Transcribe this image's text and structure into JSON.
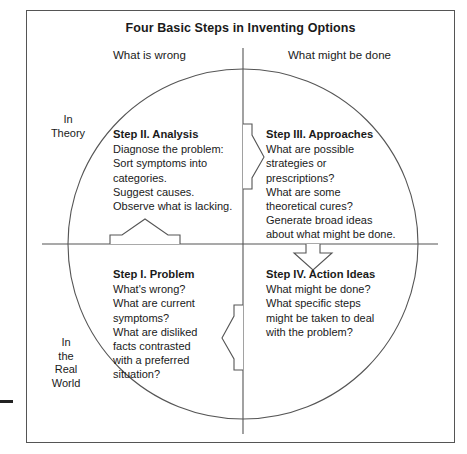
{
  "figure": {
    "title": "Four Basic Steps in Inventing Options",
    "column_headers": {
      "left": "What is wrong",
      "right": "What might be done"
    },
    "row_labels": {
      "top": [
        "In",
        "Theory"
      ],
      "bottom": [
        "In",
        "the",
        "Real",
        "World"
      ]
    },
    "quadrants": {
      "step1": {
        "heading": "Step I.  Problem",
        "lines": [
          "What's wrong?",
          "What are current",
          "symptoms?",
          "What are disliked",
          "facts contrasted",
          "with a preferred",
          "situation?"
        ]
      },
      "step2": {
        "heading": "Step II.  Analysis",
        "lines": [
          "Diagnose the problem:",
          "Sort symptoms into",
          "categories.",
          "Suggest causes.",
          "Observe what is lacking."
        ]
      },
      "step3": {
        "heading": "Step III.  Approaches",
        "lines": [
          "What are possible",
          "strategies or",
          "prescriptions?",
          "What are some",
          "theoretical cures?",
          "Generate broad ideas",
          "about what might be done."
        ]
      },
      "step4": {
        "heading": "Step IV.  Action Ideas",
        "lines": [
          "What might be done?",
          "What specific steps",
          "might be taken to deal",
          "with the problem?"
        ]
      }
    },
    "arrows": [
      {
        "name": "arrow-step1-to-step2",
        "direction": "up"
      },
      {
        "name": "arrow-step2-to-step3",
        "direction": "right"
      },
      {
        "name": "arrow-step3-to-step4",
        "direction": "down"
      },
      {
        "name": "arrow-step4-to-step1",
        "direction": "left"
      }
    ],
    "colors": {
      "stroke": "#555555",
      "text": "#1a1a1a",
      "background": "#ffffff"
    }
  }
}
